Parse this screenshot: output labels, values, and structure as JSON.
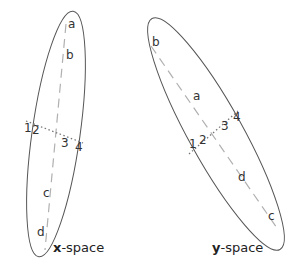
{
  "panels": [
    {
      "name": "x-space",
      "caption": {
        "bold": "x",
        "rest": "-space"
      },
      "major_axis_labels": [
        "a",
        "b",
        "c",
        "d"
      ],
      "minor_axis_labels": [
        "1",
        "2",
        "3",
        "4"
      ]
    },
    {
      "name": "y-space",
      "caption": {
        "bold": "y",
        "rest": "-space"
      },
      "major_axis_labels": [
        "b",
        "a",
        "d",
        "c"
      ],
      "minor_axis_labels": [
        "1",
        "2",
        "3",
        "4"
      ]
    }
  ],
  "labels": {
    "x": {
      "a": "a",
      "b": "b",
      "c": "c",
      "d": "d",
      "n1": "1",
      "n2": "2",
      "n3": "3",
      "n4": "4"
    },
    "y": {
      "a": "a",
      "b": "b",
      "c": "c",
      "d": "d",
      "n1": "1",
      "n2": "2",
      "n3": "3",
      "n4": "4"
    }
  },
  "colors": {
    "ellipse_stroke": "#555555",
    "dashed_axis": "#b0b0b0",
    "dotted_axis": "#777777",
    "text": "#333333"
  }
}
